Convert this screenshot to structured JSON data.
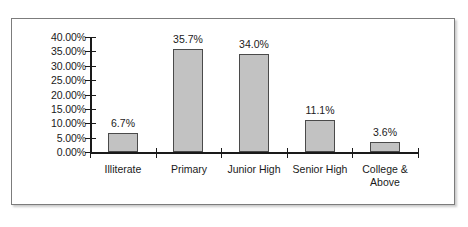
{
  "chart_data": {
    "type": "bar",
    "title": "",
    "subtitle": "",
    "xlabel": "",
    "ylabel": "",
    "categories": [
      "Illiterate",
      "Primary",
      "Junior High",
      "Senior High",
      "College & Above"
    ],
    "values": [
      6.7,
      35.7,
      34.0,
      11.1,
      3.6
    ],
    "value_labels": [
      "6.7%",
      "35.7%",
      "34.0%",
      "11.1%",
      "3.6%"
    ],
    "ylim": [
      0,
      40
    ],
    "ytick_values": [
      0,
      5,
      10,
      15,
      20,
      25,
      30,
      35,
      40
    ],
    "ytick_labels": [
      "0.00%",
      "5.00%",
      "10.00%",
      "15.00%",
      "20.00%",
      "25.00%",
      "30.00%",
      "35.00%",
      "40.00%"
    ],
    "grid": false,
    "legend": null,
    "legend_position": "none",
    "series": [
      {
        "name": "Share of population",
        "values": [
          6.7,
          35.7,
          34.0,
          11.1,
          3.6
        ]
      }
    ],
    "colors": {
      "bar_fill": "#c2c2c2",
      "bar_border": "#4a4a4a",
      "axis": "#1a1a1a",
      "text": "#1a1a1a",
      "frame_border": "#7c7c7c",
      "background": "#ffffff"
    },
    "category_label_lines": [
      [
        "Illiterate"
      ],
      [
        "Primary"
      ],
      [
        "Junior High"
      ],
      [
        "Senior High"
      ],
      [
        "College &",
        "Above"
      ]
    ]
  }
}
